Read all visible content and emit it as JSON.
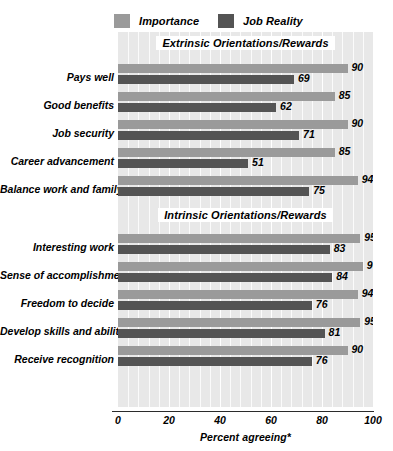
{
  "chart_data": {
    "type": "bar",
    "orientation": "horizontal",
    "title": "",
    "xlabel": "Percent agreeing*",
    "ylabel": "",
    "xlim": [
      0,
      100
    ],
    "xticks": [
      0,
      20,
      40,
      60,
      80,
      100
    ],
    "grid": true,
    "legend_position": "top",
    "series": [
      {
        "name": "Importance",
        "color": "#9a9a9a",
        "values": [
          90,
          85,
          90,
          85,
          94,
          95,
          96,
          94,
          95,
          90
        ]
      },
      {
        "name": "Job Reality",
        "color": "#545454",
        "values": [
          69,
          62,
          71,
          51,
          75,
          83,
          84,
          76,
          81,
          76
        ]
      }
    ],
    "categories": [
      "Pays well",
      "Good benefits",
      "Job security",
      "Career advancement",
      "Balance work and family",
      "Interesting work",
      "Sense of accomplishment",
      "Freedom to decide",
      "Develop skills and abilities",
      "Receive recognition"
    ],
    "groups": [
      {
        "label": "Extrinsic Orientations/Rewards",
        "start_index": 0,
        "count": 5
      },
      {
        "label": "Intrinsic Orientations/Rewards",
        "start_index": 5,
        "count": 5
      }
    ]
  },
  "legend": {
    "items": [
      {
        "label": "Importance",
        "color": "#9a9a9a"
      },
      {
        "label": "Job Reality",
        "color": "#545454"
      }
    ]
  },
  "axis": {
    "title": "Percent agreeing*",
    "ticks": [
      "0",
      "20",
      "40",
      "60",
      "80",
      "100"
    ]
  },
  "sections": {
    "extrinsic": "Extrinsic Orientations/Rewards",
    "intrinsic": "Intrinsic Orientations/Rewards"
  },
  "colors": {
    "importance": "#9a9a9a",
    "job_reality": "#545454",
    "plot_background": "#e8e8e8",
    "gridline": "#fbfbfb",
    "axis": "#2b2b2b"
  }
}
